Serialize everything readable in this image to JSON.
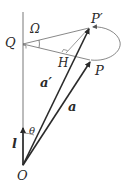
{
  "diagram": {
    "type": "vector-rotation-geometry",
    "points": {
      "O": {
        "label": "O",
        "x": 23,
        "y": 165
      },
      "Q": {
        "label": "Q",
        "x": 23,
        "y": 43
      },
      "P": {
        "label": "P",
        "x": 91,
        "y": 60
      },
      "P_prime": {
        "label": "P′",
        "x": 91,
        "y": 27
      },
      "H": {
        "label": "H",
        "x": 66,
        "y": 53
      }
    },
    "vectors": {
      "a": {
        "label": "a",
        "from": "O",
        "to": "P"
      },
      "a_prime": {
        "label": "a′",
        "from": "O",
        "to": "P′"
      },
      "l": {
        "label": "l",
        "from": "O",
        "direction": "up"
      }
    },
    "angles": {
      "theta": {
        "label": "θ"
      },
      "omega": {
        "label": "Ω"
      }
    },
    "colors": {
      "stroke": "#2a2a2a",
      "thin": "#555555",
      "background": "#ffffff"
    }
  }
}
